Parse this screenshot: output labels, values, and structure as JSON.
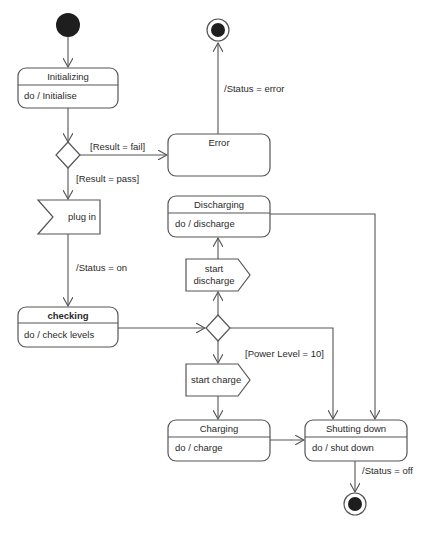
{
  "diagram": {
    "type": "UML state machine diagram",
    "states": [
      {
        "id": "initializing",
        "name": "Initializing",
        "activity": "do / Initialise"
      },
      {
        "id": "error",
        "name": "Error",
        "activity": ""
      },
      {
        "id": "checking",
        "name": "checking",
        "activity": "do / check levels"
      },
      {
        "id": "discharging",
        "name": "Discharging",
        "activity": "do / discharge"
      },
      {
        "id": "charging",
        "name": "Charging",
        "activity": "do / charge"
      },
      {
        "id": "shutting_down",
        "name": "Shutting down",
        "activity": "do / shut down"
      }
    ],
    "signals": {
      "plug_in": "plug in",
      "start_discharge_1": "start",
      "start_discharge_2": "discharge",
      "start_charge": "start charge"
    },
    "labels": {
      "result_fail": "[Result = fail]",
      "result_pass": "[Result = pass]",
      "status_error": "/Status = error",
      "status_on": "/Status = on",
      "power_level": "[Power Level = 10]",
      "status_off": "/Status = off"
    },
    "colors": {
      "stroke": "#555555",
      "text": "#2a2a2a",
      "fill": "#ffffff",
      "node": "#222222"
    }
  }
}
